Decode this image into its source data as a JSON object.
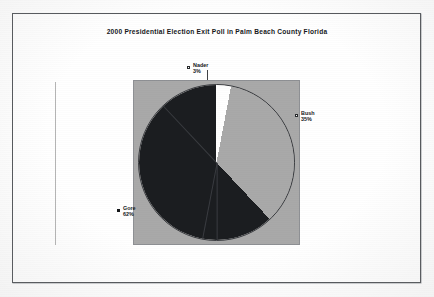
{
  "document": {
    "background_color": "#ffffff",
    "frame_color": "#55585c"
  },
  "chart_data": {
    "type": "pie",
    "title": "2000 Presidential Election Exit Poll in Palm Beach County Florida",
    "categories": [
      "Nader",
      "Bush",
      "Gore"
    ],
    "values": [
      3,
      35,
      62
    ],
    "value_suffix": "%",
    "start_angle_deg": 0,
    "direction": "clockwise",
    "plot_background_color": "#a9a9a9",
    "legend_position": "callout-labels",
    "grid": false,
    "slices": [
      {
        "name": "Nader",
        "label": "Nader",
        "value_label": "3%",
        "value": 3,
        "color": "#ffffff",
        "marker": "hollow-square"
      },
      {
        "name": "Bush",
        "label": "Bush",
        "value_label": "35%",
        "value": 35,
        "color": "#a9a9a9",
        "marker": "hollow-square"
      },
      {
        "name": "Gore",
        "label": "Gore",
        "value_label": "62%",
        "value": 62,
        "color": "#1b1d20",
        "marker": "filled-square"
      }
    ]
  }
}
